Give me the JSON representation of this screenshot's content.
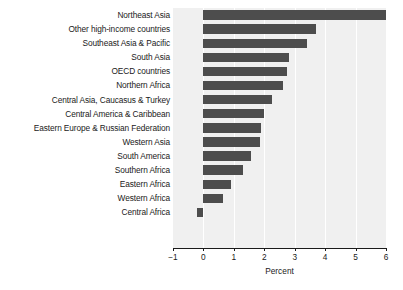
{
  "chart_data": {
    "type": "bar",
    "orientation": "horizontal",
    "title": "",
    "xlabel": "Percent",
    "ylabel": "",
    "xlim": [
      -1,
      6
    ],
    "xticks": [
      -1,
      0,
      1,
      2,
      3,
      4,
      5,
      6
    ],
    "xticklabels": [
      "−1",
      "0",
      "1",
      "2",
      "3",
      "4",
      "5",
      "6"
    ],
    "grid": true,
    "grid_axis": "x",
    "legend": "none",
    "bar_color": "#4d4d4d",
    "plot_background": "#f0f0f0",
    "categories": [
      "Northeast Asia",
      "Other high-income countries",
      "Southeast Asia & Pacific",
      "South Asia",
      "OECD countries",
      "Northern Africa",
      "Central Asia, Caucasus & Turkey",
      "Central America & Caribbean",
      "Eastern Europe & Russian Federation",
      "Western Asia",
      "South America",
      "Southern Africa",
      "Eastern Africa",
      "Western Africa",
      "Central Africa"
    ],
    "values": [
      6.1,
      3.7,
      3.4,
      2.8,
      2.75,
      2.6,
      2.25,
      2.0,
      1.9,
      1.85,
      1.55,
      1.3,
      0.9,
      0.65,
      -0.2
    ]
  }
}
